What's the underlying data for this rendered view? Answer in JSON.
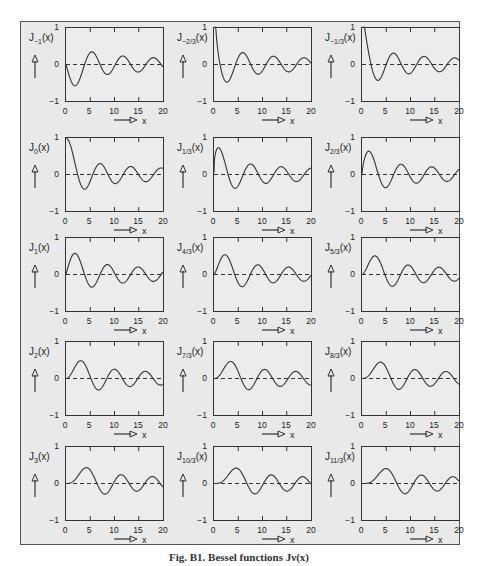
{
  "figure": {
    "caption": "Fig. B1. Bessel functions Jν(x)"
  },
  "chart_data": {
    "type": "line",
    "layout": {
      "rows": 5,
      "cols": 3,
      "grid": false,
      "legend": "none"
    },
    "xlim": [
      0,
      20
    ],
    "ylim": [
      -1,
      1
    ],
    "xticks": [
      0,
      5,
      10,
      15,
      20
    ],
    "yticks": [
      -1,
      0,
      1
    ],
    "xlabel": "x",
    "reference_line": {
      "y": 0,
      "style": "dashed"
    },
    "panels": [
      {
        "label": "J",
        "order_label": "−1",
        "order": -1
      },
      {
        "label": "J",
        "order_label": "−2/3",
        "order": -0.6667
      },
      {
        "label": "J",
        "order_label": "−1/3",
        "order": -0.3333
      },
      {
        "label": "J",
        "order_label": "0",
        "order": 0
      },
      {
        "label": "J",
        "order_label": "1/3",
        "order": 0.3333
      },
      {
        "label": "J",
        "order_label": "2/3",
        "order": 0.6667
      },
      {
        "label": "J",
        "order_label": "1",
        "order": 1
      },
      {
        "label": "J",
        "order_label": "4/3",
        "order": 1.3333
      },
      {
        "label": "J",
        "order_label": "5/3",
        "order": 1.6667
      },
      {
        "label": "J",
        "order_label": "2",
        "order": 2
      },
      {
        "label": "J",
        "order_label": "7/3",
        "order": 2.3333
      },
      {
        "label": "J",
        "order_label": "8/3",
        "order": 2.6667
      },
      {
        "label": "J",
        "order_label": "3",
        "order": 3
      },
      {
        "label": "J",
        "order_label": "10/3",
        "order": 3.3333
      },
      {
        "label": "J",
        "order_label": "11/3",
        "order": 3.6667
      }
    ]
  },
  "axis_text": {
    "y_top": "1",
    "y_mid": "0",
    "y_bot": "−1",
    "x0": "0",
    "x5": "5",
    "x10": "10",
    "x15": "15",
    "x20": "20",
    "xname": "x",
    "arg": "(x)"
  },
  "colors": {
    "curve": "#333333",
    "frame": "#555555",
    "background": "#e9e9e9"
  }
}
